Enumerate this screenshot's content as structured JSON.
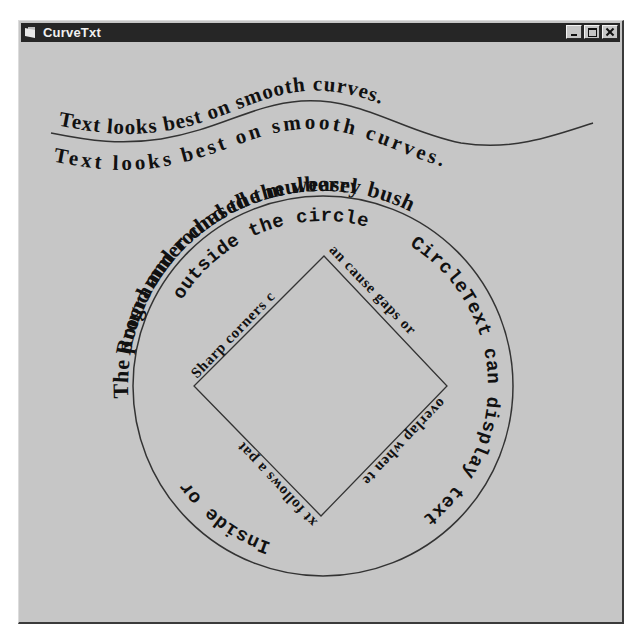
{
  "window": {
    "title": "CurveTxt",
    "buttons": {
      "minimize": "minimize-button",
      "maximize": "maximize-button",
      "close": "close-button"
    }
  },
  "wave": {
    "text_above": "Text looks best on smooth curves.",
    "text_below": "Text looks best on smooth curves."
  },
  "circle": {
    "outer_text": "Round and round the mulberry bush",
    "outer_text_bottom": "The programmer chased the weasel",
    "inner_text_top": "outside the circle",
    "inner_text_right": "CircleText can display text",
    "inner_text_left": "Inside or"
  },
  "diamond": {
    "text_top_left": "Sharp corners c",
    "text_top_right": "an cause gaps or",
    "text_bottom_right": "overlap when te",
    "text_bottom_left": "xt follows a pat"
  },
  "colors": {
    "background": "#c6c6c6",
    "titlebar": "#262626",
    "text": "#111111",
    "line": "#333333"
  }
}
